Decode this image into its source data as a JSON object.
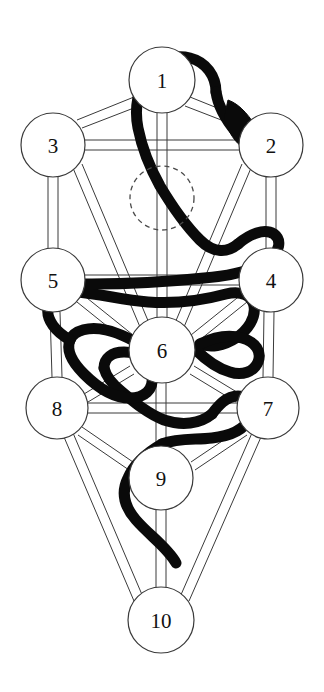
{
  "diagram": {
    "type": "kabbalistic-tree-diagram",
    "background_color": "#ffffff",
    "line_color": "#3a3a3a",
    "serpent_color": "#0a0a0a",
    "label_color": "#111111",
    "sephiroth": [
      {
        "id": "s1",
        "label": "1",
        "cx": 162,
        "cy": 80,
        "r": 33
      },
      {
        "id": "s2",
        "label": "2",
        "cx": 271,
        "cy": 145,
        "r": 32
      },
      {
        "id": "s3",
        "label": "3",
        "cx": 53,
        "cy": 145,
        "r": 32
      },
      {
        "id": "s4",
        "label": "4",
        "cx": 271,
        "cy": 280,
        "r": 32
      },
      {
        "id": "s5",
        "label": "5",
        "cx": 53,
        "cy": 280,
        "r": 32
      },
      {
        "id": "s6",
        "label": "6",
        "cx": 162,
        "cy": 350,
        "r": 33
      },
      {
        "id": "s7",
        "label": "7",
        "cx": 268,
        "cy": 408,
        "r": 31
      },
      {
        "id": "s8",
        "label": "8",
        "cx": 57,
        "cy": 408,
        "r": 31
      },
      {
        "id": "s9",
        "label": "9",
        "cx": 161,
        "cy": 478,
        "r": 32
      },
      {
        "id": "s10",
        "label": "10",
        "cx": 161,
        "cy": 620,
        "r": 33
      }
    ],
    "hidden_node": {
      "id": "daath",
      "label": "",
      "cx": 162,
      "cy": 198,
      "r": 32,
      "style": "dashed"
    },
    "paths": [
      {
        "from": "s1",
        "to": "s2"
      },
      {
        "from": "s1",
        "to": "s3"
      },
      {
        "from": "s1",
        "to": "s6"
      },
      {
        "from": "s2",
        "to": "s3"
      },
      {
        "from": "s2",
        "to": "s4"
      },
      {
        "from": "s2",
        "to": "s6"
      },
      {
        "from": "s3",
        "to": "s5"
      },
      {
        "from": "s3",
        "to": "s6"
      },
      {
        "from": "s4",
        "to": "s5"
      },
      {
        "from": "s4",
        "to": "s6"
      },
      {
        "from": "s4",
        "to": "s7"
      },
      {
        "from": "s5",
        "to": "s6"
      },
      {
        "from": "s5",
        "to": "s8"
      },
      {
        "from": "s6",
        "to": "s7"
      },
      {
        "from": "s6",
        "to": "s8"
      },
      {
        "from": "s6",
        "to": "s9"
      },
      {
        "from": "s7",
        "to": "s8"
      },
      {
        "from": "s7",
        "to": "s9"
      },
      {
        "from": "s7",
        "to": "s10"
      },
      {
        "from": "s8",
        "to": "s9"
      },
      {
        "from": "s8",
        "to": "s10"
      },
      {
        "from": "s9",
        "to": "s10"
      }
    ],
    "serpent": {
      "name": "serpent-of-wisdom",
      "description": "thick black serpent winding through the paths from bottom to top",
      "head_position": {
        "x": 246,
        "y": 152
      },
      "tail_position": {
        "x": 175,
        "y": 560
      }
    }
  }
}
